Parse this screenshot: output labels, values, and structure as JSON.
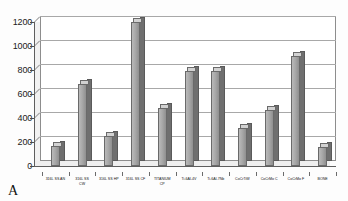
{
  "figure": {
    "panel_label": "A",
    "background_color": "#ffffff",
    "bar_color": "#a9a9a9",
    "bar_side_color": "#6f6f6f",
    "axis_color": "#5e5e5e",
    "grid_color": "#a8a8a8"
  },
  "chart_data": {
    "type": "bar",
    "title": "",
    "subtitle": "",
    "xlabel": "",
    "ylabel": "",
    "ylim": [
      0,
      1200
    ],
    "yticks": [
      0,
      200,
      400,
      600,
      800,
      1000,
      1200
    ],
    "ytick_labels": [
      "0",
      "200",
      "400",
      "600",
      "800",
      "1000",
      "1200"
    ],
    "grid": true,
    "legend": false,
    "legend_position": "none",
    "style": "3d-column",
    "annotations": [
      "A"
    ],
    "categories": [
      "316L SS AN",
      "316L SS\nCW",
      "316L SS HP",
      "316L SS CF",
      "TITANIUM\nCP",
      "Ti-6Al-4V",
      "Ti-6Al-7Nb",
      "CoCrTiW",
      "CoCrMo C",
      "CoCrMo F",
      "BONE"
    ],
    "values": [
      170,
      680,
      250,
      1200,
      480,
      790,
      790,
      320,
      470,
      920,
      160
    ]
  }
}
